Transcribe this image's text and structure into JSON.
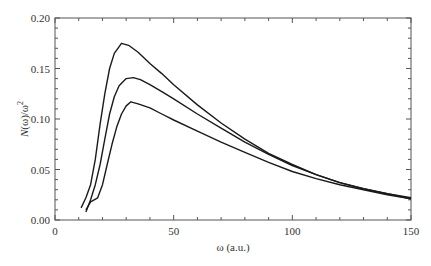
{
  "chart_data": {
    "type": "line",
    "title": "",
    "xlabel": "ω (a.u.)",
    "ylabel": "N(ω)/ω²",
    "xlim": [
      0,
      150
    ],
    "ylim": [
      0,
      0.2
    ],
    "x_ticks": [
      0,
      50,
      100,
      150
    ],
    "x_tick_labels": [
      "0",
      "50",
      "100",
      "150"
    ],
    "y_ticks": [
      0.0,
      0.05,
      0.1,
      0.15,
      0.2
    ],
    "y_tick_labels": [
      "0.00",
      "0.05",
      "0.10",
      "0.15",
      "0.20"
    ],
    "grid": false,
    "legend": null,
    "series": [
      {
        "name": "curve-1 (highest)",
        "x": [
          11,
          13,
          15,
          17,
          19,
          21,
          23,
          25,
          28,
          31,
          35,
          40,
          45,
          50,
          60,
          70,
          80,
          90,
          100,
          110,
          120,
          130,
          140,
          150
        ],
        "y": [
          0.012,
          0.022,
          0.035,
          0.06,
          0.095,
          0.125,
          0.15,
          0.165,
          0.175,
          0.173,
          0.166,
          0.155,
          0.145,
          0.134,
          0.114,
          0.096,
          0.08,
          0.066,
          0.055,
          0.045,
          0.037,
          0.031,
          0.026,
          0.022
        ]
      },
      {
        "name": "curve-2 (middle)",
        "x": [
          13,
          15,
          17,
          19,
          21,
          23,
          25,
          27,
          30,
          33,
          36,
          40,
          45,
          50,
          60,
          70,
          80,
          90,
          100,
          110,
          120,
          130,
          140,
          150
        ],
        "y": [
          0.008,
          0.02,
          0.035,
          0.055,
          0.08,
          0.105,
          0.122,
          0.133,
          0.14,
          0.141,
          0.139,
          0.134,
          0.127,
          0.12,
          0.105,
          0.091,
          0.077,
          0.065,
          0.054,
          0.045,
          0.037,
          0.031,
          0.026,
          0.021
        ]
      },
      {
        "name": "curve-3 (lowest)",
        "x": [
          13,
          15,
          18,
          20,
          22,
          24,
          26,
          28,
          30,
          32,
          35,
          40,
          45,
          50,
          60,
          70,
          80,
          90,
          100,
          110,
          120,
          130,
          140,
          150
        ],
        "y": [
          0.01,
          0.018,
          0.022,
          0.035,
          0.055,
          0.075,
          0.092,
          0.105,
          0.113,
          0.117,
          0.115,
          0.111,
          0.105,
          0.099,
          0.088,
          0.077,
          0.067,
          0.057,
          0.048,
          0.041,
          0.035,
          0.03,
          0.025,
          0.021
        ]
      }
    ]
  },
  "colors": {
    "line": "#1a1a1a",
    "axis": "#555555",
    "text": "#333333",
    "background": "#ffffff"
  }
}
